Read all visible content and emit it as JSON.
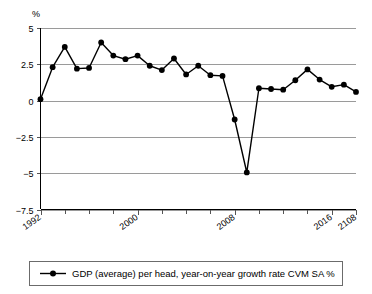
{
  "chart_data": {
    "type": "line",
    "title": "",
    "subtitle": "",
    "xlabel": "",
    "ylabel": "",
    "unit_label": "%",
    "ylim": [
      -7.5,
      5
    ],
    "yticks": [
      5,
      2.5,
      0,
      -2.5,
      -5,
      -7.5
    ],
    "ytick_labels": [
      "5",
      "2.5",
      "0",
      "−2.5",
      "−5",
      "−7.5"
    ],
    "grid": true,
    "grid_axis": "y",
    "legend_position": "bottom",
    "xlim": [
      1992,
      2018
    ],
    "xticks": [
      1992,
      2000,
      2008,
      2016,
      2018
    ],
    "xtick_labels": [
      "1992",
      "2000",
      "2008",
      "2016",
      "2108"
    ],
    "minor_xticks": [
      1994,
      1996,
      1998,
      2002,
      2004,
      2006,
      2010,
      2012,
      2014
    ],
    "series": [
      {
        "name": "GDP (average) per head, year-on-year growth rate CVM SA %",
        "color": "#000000",
        "marker": "circle",
        "x": [
          1992,
          1993,
          1994,
          1995,
          1996,
          1997,
          1998,
          1999,
          2000,
          2001,
          2002,
          2003,
          2004,
          2005,
          2006,
          2007,
          2008,
          2009,
          2010,
          2011,
          2012,
          2013,
          2014,
          2015,
          2016,
          2017,
          2018
        ],
        "values": [
          0.1,
          2.3,
          3.7,
          2.2,
          2.25,
          4.0,
          3.1,
          2.85,
          3.1,
          2.4,
          2.1,
          2.9,
          1.8,
          2.4,
          1.75,
          1.7,
          -1.3,
          -4.95,
          0.85,
          0.8,
          0.75,
          1.4,
          2.15,
          1.45,
          0.95,
          1.1,
          0.6
        ]
      }
    ]
  },
  "legend": {
    "entries": [
      {
        "label": "GDP (average) per head, year-on-year growth rate CVM SA %",
        "color": "#000000"
      }
    ]
  },
  "colors": {
    "line": "#000000",
    "grid": "#9a9a9a",
    "axis": "#000000",
    "legend_border": "#6b6b6b",
    "background": "#ffffff"
  }
}
